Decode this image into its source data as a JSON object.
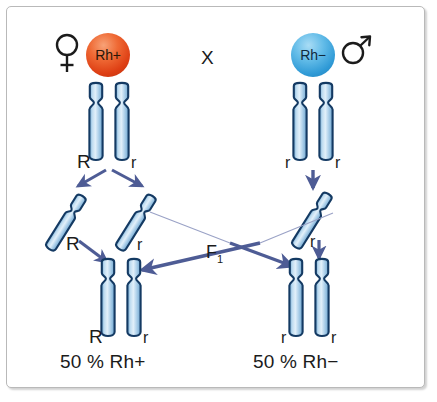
{
  "figure": {
    "cross_symbol": "X",
    "f1_label": "F",
    "f1_subscript": "1"
  },
  "colors": {
    "chromosome_fill": "#a8cde8",
    "chromosome_outline": "#1b3b66",
    "arrow": "#4e5c95",
    "thin_arrow": "#8d95bd",
    "rh_positive": "#e2511a",
    "rh_negative": "#3ea3da",
    "frame": "#b9b9b9",
    "text": "#1b1b1b"
  },
  "parents": {
    "mother": {
      "sex_icon": "female-sex-icon",
      "sex_symbol": "♀",
      "rh_label": "Rh+",
      "rh_type": "positive",
      "genotype_left": "R",
      "genotype_right": "r"
    },
    "father": {
      "sex_icon": "male-sex-icon",
      "sex_symbol": "♂",
      "rh_label": "Rh−",
      "rh_type": "negative",
      "genotype_left": "r",
      "genotype_right": "r"
    }
  },
  "gametes": {
    "maternal": [
      {
        "allele": "R"
      },
      {
        "allele": "r"
      }
    ],
    "paternal": [
      {
        "allele": "r"
      }
    ]
  },
  "offspring": [
    {
      "genotype_left": "R",
      "genotype_right": "r",
      "percent": "50 %",
      "phenotype": "Rh+",
      "result_text": "50 % Rh+"
    },
    {
      "genotype_left": "r",
      "genotype_right": "r",
      "percent": "50 %",
      "phenotype": "Rh−",
      "result_text": "50 % Rh−"
    }
  ]
}
